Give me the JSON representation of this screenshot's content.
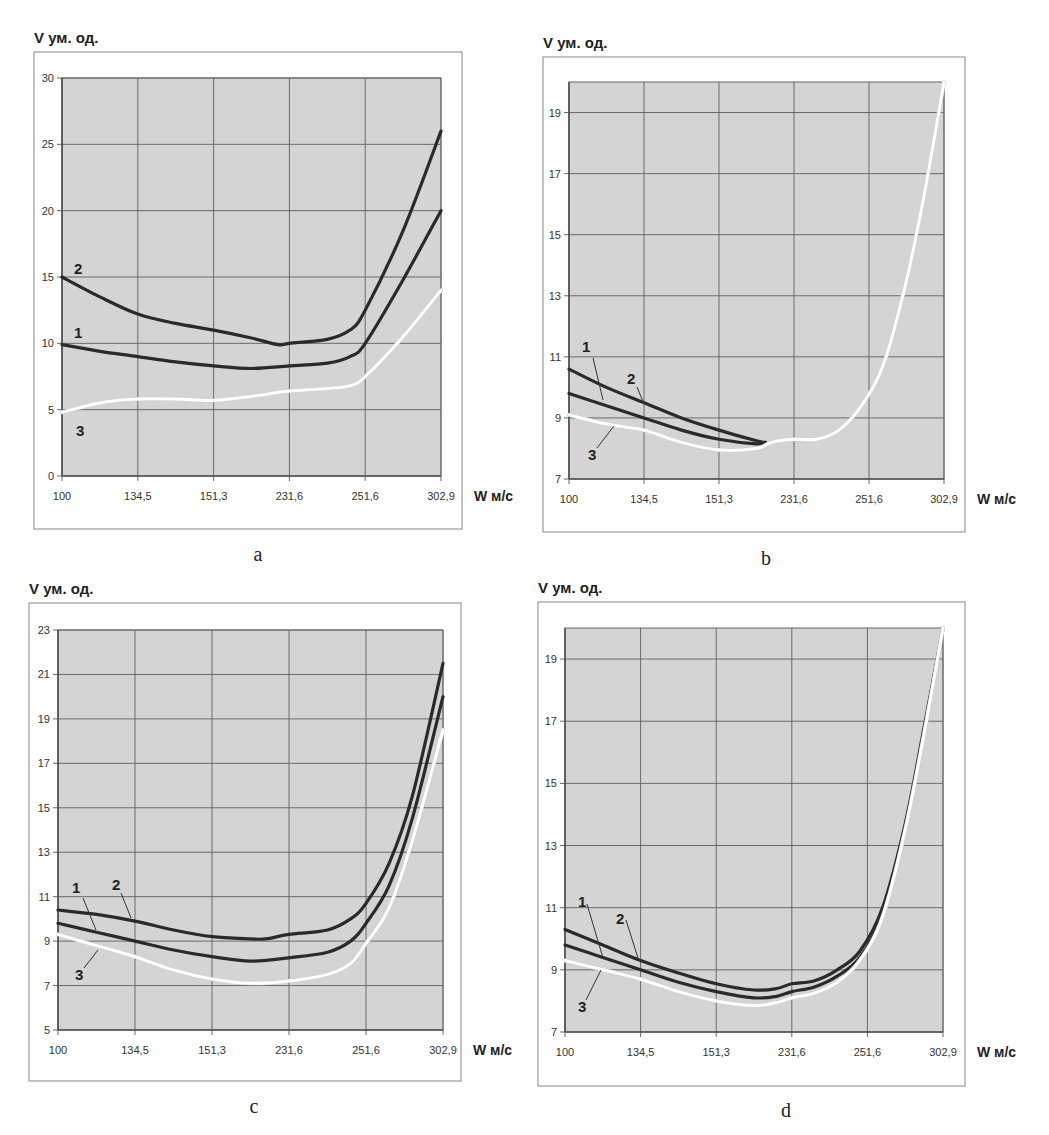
{
  "figure": {
    "panels": [
      "a",
      "b",
      "c",
      "d"
    ]
  },
  "chart_data": [
    {
      "id": "a",
      "type": "line",
      "caption": "a",
      "title": "",
      "ylabel": "V ум. од.",
      "xlabel": "W м/с",
      "categories": [
        "100",
        "134,5",
        "151,3",
        "231,6",
        "251,6",
        "302,9"
      ],
      "yticks": [
        0,
        5,
        10,
        15,
        20,
        25,
        30
      ],
      "ylim": [
        0,
        30
      ],
      "grid": true,
      "legend": "inline numbered labels",
      "frame": {
        "outer": [
          34,
          52,
          462,
          529
        ],
        "plot": [
          62,
          78,
          441,
          476
        ]
      },
      "series": [
        {
          "name": "2",
          "color": "#2a2a2a",
          "points": [
            [
              0,
              15
            ],
            [
              0.5,
              13.5
            ],
            [
              1,
              12.2
            ],
            [
              1.5,
              11.5
            ],
            [
              2,
              11
            ],
            [
              2.5,
              10.4
            ],
            [
              2.85,
              9.9
            ],
            [
              3,
              10
            ],
            [
              3.5,
              10.3
            ],
            [
              3.8,
              11
            ],
            [
              4,
              12.5
            ],
            [
              4.5,
              18.5
            ],
            [
              5,
              26
            ]
          ]
        },
        {
          "name": "1",
          "color": "#2a2a2a",
          "points": [
            [
              0,
              9.9
            ],
            [
              0.5,
              9.4
            ],
            [
              1,
              9
            ],
            [
              1.5,
              8.6
            ],
            [
              2,
              8.3
            ],
            [
              2.5,
              8.1
            ],
            [
              3,
              8.3
            ],
            [
              3.5,
              8.5
            ],
            [
              3.8,
              9
            ],
            [
              4,
              10
            ],
            [
              4.5,
              14.8
            ],
            [
              5,
              20
            ]
          ]
        },
        {
          "name": "3",
          "color": "#ffffff",
          "points": [
            [
              0,
              4.8
            ],
            [
              0.5,
              5.5
            ],
            [
              1,
              5.8
            ],
            [
              1.5,
              5.8
            ],
            [
              2,
              5.7
            ],
            [
              2.5,
              6
            ],
            [
              3,
              6.4
            ],
            [
              3.5,
              6.6
            ],
            [
              3.8,
              6.8
            ],
            [
              4,
              7.5
            ],
            [
              4.5,
              10.5
            ],
            [
              5,
              14
            ]
          ]
        }
      ],
      "labels": [
        {
          "text": "2",
          "x": 74,
          "y": 274
        },
        {
          "text": "1",
          "x": 74,
          "y": 338
        },
        {
          "text": "3",
          "x": 76,
          "y": 436
        }
      ]
    },
    {
      "id": "b",
      "type": "line",
      "caption": "b",
      "title": "",
      "ylabel": "V ум. од.",
      "xlabel": "W м/с",
      "categories": [
        "100",
        "134,5",
        "151,3",
        "231,6",
        "251,6",
        "302,9"
      ],
      "yticks": [
        7,
        9,
        11,
        13,
        15,
        17,
        19
      ],
      "ylim": [
        7,
        20
      ],
      "grid": true,
      "legend": "inline numbered labels with leaders",
      "frame": {
        "outer": [
          543,
          57,
          965,
          532
        ],
        "plot": [
          569,
          82,
          944,
          479
        ]
      },
      "series": [
        {
          "name": "2",
          "color": "#2a2a2a",
          "points": [
            [
              0,
              10.6
            ],
            [
              0.5,
              10
            ],
            [
              1,
              9.5
            ],
            [
              1.5,
              9
            ],
            [
              2,
              8.6
            ],
            [
              2.5,
              8.25
            ],
            [
              2.62,
              8.2
            ]
          ]
        },
        {
          "name": "1",
          "color": "#2a2a2a",
          "points": [
            [
              0,
              9.8
            ],
            [
              0.5,
              9.4
            ],
            [
              1,
              9
            ],
            [
              1.5,
              8.6
            ],
            [
              2,
              8.3
            ],
            [
              2.5,
              8.15
            ],
            [
              2.62,
              8.2
            ]
          ]
        },
        {
          "name": "3",
          "color": "#ffffff",
          "points": [
            [
              0,
              9.1
            ],
            [
              0.5,
              8.8
            ],
            [
              1,
              8.6
            ],
            [
              1.5,
              8.2
            ],
            [
              2,
              7.95
            ],
            [
              2.5,
              8
            ],
            [
              2.7,
              8.2
            ],
            [
              3,
              8.3
            ],
            [
              3.3,
              8.3
            ],
            [
              3.6,
              8.6
            ],
            [
              3.9,
              9.4
            ],
            [
              4.2,
              10.8
            ],
            [
              4.5,
              13.5
            ],
            [
              4.75,
              16.5
            ],
            [
              5,
              20
            ]
          ]
        }
      ],
      "labels": [
        {
          "text": "1",
          "x": 582,
          "y": 352,
          "lx1": 593,
          "ly1": 358,
          "lx2": 603,
          "ly2": 400
        },
        {
          "text": "2",
          "x": 627,
          "y": 384,
          "lx1": 637,
          "ly1": 387,
          "lx2": 644,
          "ly2": 404
        },
        {
          "text": "3",
          "x": 588,
          "y": 460,
          "lx1": 597,
          "ly1": 448,
          "lx2": 614,
          "ly2": 426
        }
      ]
    },
    {
      "id": "c",
      "type": "line",
      "caption": "c",
      "title": "",
      "ylabel": "V ум. од.",
      "xlabel": "W м/с",
      "categories": [
        "100",
        "134,5",
        "151,3",
        "231,6",
        "251,6",
        "302,9"
      ],
      "yticks": [
        5,
        7,
        9,
        11,
        13,
        15,
        17,
        19,
        21,
        23
      ],
      "ylim": [
        5,
        23
      ],
      "grid": true,
      "legend": "inline numbered labels with leaders",
      "frame": {
        "outer": [
          29,
          603,
          461,
          1081
        ],
        "plot": [
          58,
          630,
          443,
          1030
        ]
      },
      "series": [
        {
          "name": "2",
          "color": "#2a2a2a",
          "points": [
            [
              0,
              10.4
            ],
            [
              0.5,
              10.2
            ],
            [
              1,
              9.9
            ],
            [
              1.5,
              9.5
            ],
            [
              2,
              9.2
            ],
            [
              2.5,
              9.1
            ],
            [
              2.7,
              9.1
            ],
            [
              3,
              9.3
            ],
            [
              3.5,
              9.5
            ],
            [
              3.8,
              10
            ],
            [
              4,
              10.7
            ],
            [
              4.3,
              12.5
            ],
            [
              4.6,
              15.5
            ],
            [
              5,
              21.5
            ]
          ]
        },
        {
          "name": "1",
          "color": "#2a2a2a",
          "points": [
            [
              0,
              9.8
            ],
            [
              0.5,
              9.4
            ],
            [
              1,
              9
            ],
            [
              1.5,
              8.6
            ],
            [
              2,
              8.3
            ],
            [
              2.5,
              8.1
            ],
            [
              3,
              8.25
            ],
            [
              3.5,
              8.5
            ],
            [
              3.8,
              9
            ],
            [
              4,
              9.8
            ],
            [
              4.3,
              11.5
            ],
            [
              4.6,
              14.5
            ],
            [
              5,
              20
            ]
          ]
        },
        {
          "name": "3",
          "color": "#ffffff",
          "points": [
            [
              0,
              9.3
            ],
            [
              0.5,
              8.8
            ],
            [
              1,
              8.3
            ],
            [
              1.5,
              7.7
            ],
            [
              2,
              7.3
            ],
            [
              2.5,
              7.1
            ],
            [
              3,
              7.2
            ],
            [
              3.5,
              7.5
            ],
            [
              3.8,
              8
            ],
            [
              4,
              8.9
            ],
            [
              4.3,
              10.5
            ],
            [
              4.6,
              13.5
            ],
            [
              5,
              18.5
            ]
          ]
        }
      ],
      "labels": [
        {
          "text": "1",
          "x": 72,
          "y": 893,
          "lx1": 83,
          "ly1": 898,
          "lx2": 96,
          "ly2": 930
        },
        {
          "text": "2",
          "x": 112,
          "y": 890,
          "lx1": 121,
          "ly1": 893,
          "lx2": 131,
          "ly2": 918
        },
        {
          "text": "3",
          "x": 75,
          "y": 980,
          "lx1": 84,
          "ly1": 968,
          "lx2": 98,
          "ly2": 950
        }
      ]
    },
    {
      "id": "d",
      "type": "line",
      "caption": "d",
      "title": "",
      "ylabel": "V ум. од.",
      "xlabel": "W м/с",
      "categories": [
        "100",
        "134,5",
        "151,3",
        "231,6",
        "251,6",
        "302,9"
      ],
      "yticks": [
        7,
        9,
        11,
        13,
        15,
        17,
        19
      ],
      "ylim": [
        7,
        20
      ],
      "grid": true,
      "legend": "inline numbered labels with leaders",
      "frame": {
        "outer": [
          538,
          602,
          965,
          1086
        ],
        "plot": [
          565,
          628,
          943,
          1032
        ]
      },
      "series": [
        {
          "name": "2",
          "color": "#2a2a2a",
          "points": [
            [
              0,
              10.3
            ],
            [
              0.5,
              9.8
            ],
            [
              1,
              9.3
            ],
            [
              1.5,
              8.9
            ],
            [
              2,
              8.55
            ],
            [
              2.5,
              8.35
            ],
            [
              2.8,
              8.4
            ],
            [
              3,
              8.55
            ],
            [
              3.3,
              8.65
            ],
            [
              3.6,
              9
            ],
            [
              3.9,
              9.6
            ],
            [
              4.2,
              11
            ],
            [
              4.5,
              13.7
            ],
            [
              4.75,
              16.8
            ],
            [
              5,
              20
            ]
          ]
        },
        {
          "name": "1",
          "color": "#2a2a2a",
          "points": [
            [
              0,
              9.8
            ],
            [
              0.5,
              9.4
            ],
            [
              1,
              9
            ],
            [
              1.5,
              8.6
            ],
            [
              2,
              8.3
            ],
            [
              2.5,
              8.1
            ],
            [
              2.8,
              8.15
            ],
            [
              3,
              8.3
            ],
            [
              3.3,
              8.45
            ],
            [
              3.6,
              8.8
            ],
            [
              3.9,
              9.4
            ],
            [
              4.2,
              10.8
            ],
            [
              4.5,
              13.6
            ],
            [
              4.75,
              16.7
            ],
            [
              5,
              20
            ]
          ]
        },
        {
          "name": "3",
          "color": "#ffffff",
          "points": [
            [
              0,
              9.3
            ],
            [
              0.5,
              9
            ],
            [
              1,
              8.7
            ],
            [
              1.5,
              8.3
            ],
            [
              2,
              8
            ],
            [
              2.5,
              7.85
            ],
            [
              2.8,
              7.95
            ],
            [
              3,
              8.1
            ],
            [
              3.3,
              8.25
            ],
            [
              3.6,
              8.6
            ],
            [
              3.9,
              9.3
            ],
            [
              4.2,
              10.7
            ],
            [
              4.5,
              13.5
            ],
            [
              4.75,
              16.6
            ],
            [
              5,
              20
            ]
          ]
        }
      ],
      "labels": [
        {
          "text": "1",
          "x": 578,
          "y": 907,
          "lx1": 587,
          "ly1": 904,
          "lx2": 603,
          "ly2": 958
        },
        {
          "text": "2",
          "x": 616,
          "y": 924,
          "lx1": 626,
          "ly1": 920,
          "lx2": 638,
          "ly2": 958
        },
        {
          "text": "3",
          "x": 578,
          "y": 1012,
          "lx1": 586,
          "ly1": 1000,
          "lx2": 601,
          "ly2": 970
        }
      ]
    }
  ],
  "captions": [
    {
      "text": "a",
      "x": 258,
      "y": 561
    },
    {
      "text": "b",
      "x": 766,
      "y": 565
    },
    {
      "text": "c",
      "x": 254,
      "y": 1113
    },
    {
      "text": "d",
      "x": 786,
      "y": 1117
    }
  ]
}
